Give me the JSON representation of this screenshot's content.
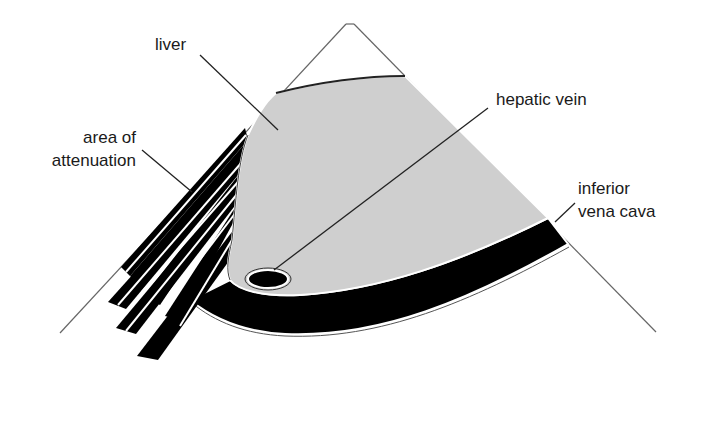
{
  "diagram": {
    "colors": {
      "background": "#ffffff",
      "liver_fill": "#cfcfcf",
      "dark_structures": "#000000",
      "outline": "#555555",
      "leader_line": "#222222"
    },
    "labels": {
      "liver": "liver",
      "hepatic_vein": "hepatic vein",
      "area_line1": "area of",
      "area_line2": "attenuation",
      "ivc_line1": "inferior",
      "ivc_line2": "vena cava"
    }
  }
}
